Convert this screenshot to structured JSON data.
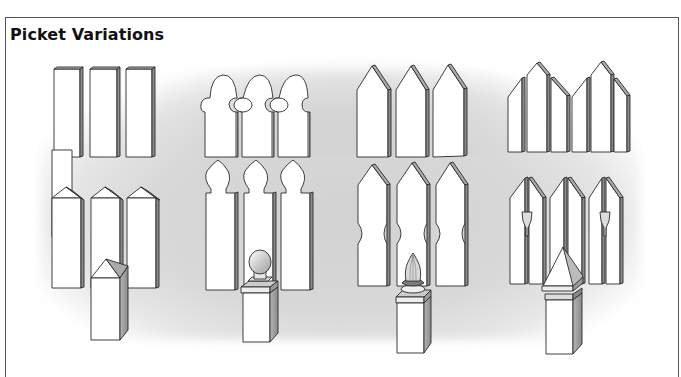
{
  "page": {
    "title": "Picket Variations"
  },
  "palette": {
    "outline": "#2a2a2a",
    "face": "#ffffff",
    "side": "#9a9a9a",
    "background_shade": "#d4d4d4",
    "frame": "#555555"
  },
  "illustrations": {
    "rows": [
      {
        "row": 1,
        "items": [
          {
            "icon": "flat-top-picket-icon",
            "label": "Flat-top pickets"
          },
          {
            "icon": "round-arch-picket-icon",
            "label": "Arched scalloped pickets"
          },
          {
            "icon": "pointed-picket-icon",
            "label": "Pointed pickets"
          },
          {
            "icon": "staggered-pointed-picket-icon",
            "label": "Staggered pointed pickets"
          }
        ]
      },
      {
        "row": 2,
        "items": [
          {
            "icon": "pyramid-top-picket-icon",
            "label": "Pyramid-top pickets"
          },
          {
            "icon": "gothic-arch-picket-icon",
            "label": "Gothic arch pickets"
          },
          {
            "icon": "pointed-notched-picket-icon",
            "label": "Pointed notched pickets"
          },
          {
            "icon": "pointed-cutout-picket-icon",
            "label": "Pointed pickets with cutouts"
          }
        ]
      },
      {
        "row": 3,
        "items": [
          {
            "icon": "pyramid-post-icon",
            "label": "Pyramid-top post"
          },
          {
            "icon": "ball-finial-post-icon",
            "label": "Ball finial post"
          },
          {
            "icon": "acorn-finial-post-icon",
            "label": "Acorn finial post"
          },
          {
            "icon": "capped-pyramid-post-icon",
            "label": "Capped pyramid post"
          }
        ]
      }
    ]
  }
}
